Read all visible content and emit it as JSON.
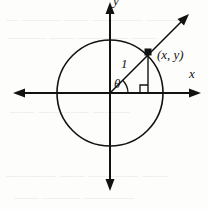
{
  "figure": {
    "background_color": "#fdfdfc",
    "ink_color": "#121212",
    "ghost_color": "#d9d7d2"
  },
  "labels": {
    "x_axis": "x",
    "y_axis": "y",
    "point": "(x, y)",
    "radius": "1",
    "angle": "θ"
  },
  "geometry": {
    "center": {
      "x": 110,
      "y": 93
    },
    "circle_radius": 53,
    "point": {
      "x": 148,
      "y": 52
    },
    "ray_tip": {
      "x": 189,
      "y": 14
    },
    "x_axis_left_tip": {
      "x": 13,
      "y": 93
    },
    "x_axis_right_tip": {
      "x": 201,
      "y": 93
    },
    "y_axis_top_tip": {
      "x": 110,
      "y": 2
    },
    "y_axis_bottom_tip": {
      "x": 110,
      "y": 191
    },
    "right_angle_size": 8
  },
  "background_text": {
    "line_top": "— ——— —— ———— ———",
    "line_upper": "——— —— ———— ——",
    "line_mid": "—— ———— ———",
    "line_lower": "———— —— ———— ——",
    "line_bottom": "—— ——— ————"
  }
}
